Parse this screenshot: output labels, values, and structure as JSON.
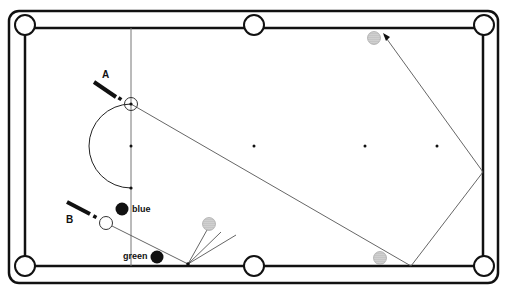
{
  "diagram": {
    "type": "billiards-table-shot-diagram",
    "colors": {
      "line": "#111111",
      "path": "#555555",
      "shaded_ball": "#bdbdbd",
      "black_ball": "#111111",
      "background": "#ffffff"
    },
    "labels": {
      "cue_a": "A",
      "cue_b": "B",
      "ball_blue": "blue",
      "ball_green": "green"
    },
    "table": {
      "outer_rail": {
        "x": 9,
        "y": 11,
        "w": 489,
        "h": 272,
        "r": 10
      },
      "cushion": {
        "x1": 25,
        "y1": 28,
        "x2": 483,
        "y2": 266
      },
      "pockets": [
        {
          "name": "top-left",
          "x": 25,
          "y": 25
        },
        {
          "name": "top-middle",
          "x": 254,
          "y": 25
        },
        {
          "name": "top-right",
          "x": 484,
          "y": 25
        },
        {
          "name": "bottom-left",
          "x": 25,
          "y": 266
        },
        {
          "name": "bottom-middle",
          "x": 254,
          "y": 266
        },
        {
          "name": "bottom-right",
          "x": 484,
          "y": 266
        }
      ],
      "spots": [
        {
          "x": 131,
          "y": 146
        },
        {
          "x": 254,
          "y": 146
        },
        {
          "x": 365,
          "y": 146
        },
        {
          "x": 437,
          "y": 146
        }
      ]
    },
    "balls": [
      {
        "name": "cue-ball-a",
        "x": 131,
        "y": 104,
        "style": "white"
      },
      {
        "name": "cue-ball-b",
        "x": 106,
        "y": 223,
        "style": "white"
      },
      {
        "name": "blue-ball",
        "x": 122,
        "y": 209,
        "style": "black"
      },
      {
        "name": "green-ball",
        "x": 157,
        "y": 257,
        "style": "black"
      },
      {
        "name": "object-ball-top",
        "x": 374,
        "y": 38,
        "style": "shaded"
      },
      {
        "name": "object-ball-bottom",
        "x": 380,
        "y": 258,
        "style": "shaded"
      },
      {
        "name": "object-ball-left",
        "x": 209,
        "y": 224,
        "style": "shaded"
      }
    ]
  }
}
